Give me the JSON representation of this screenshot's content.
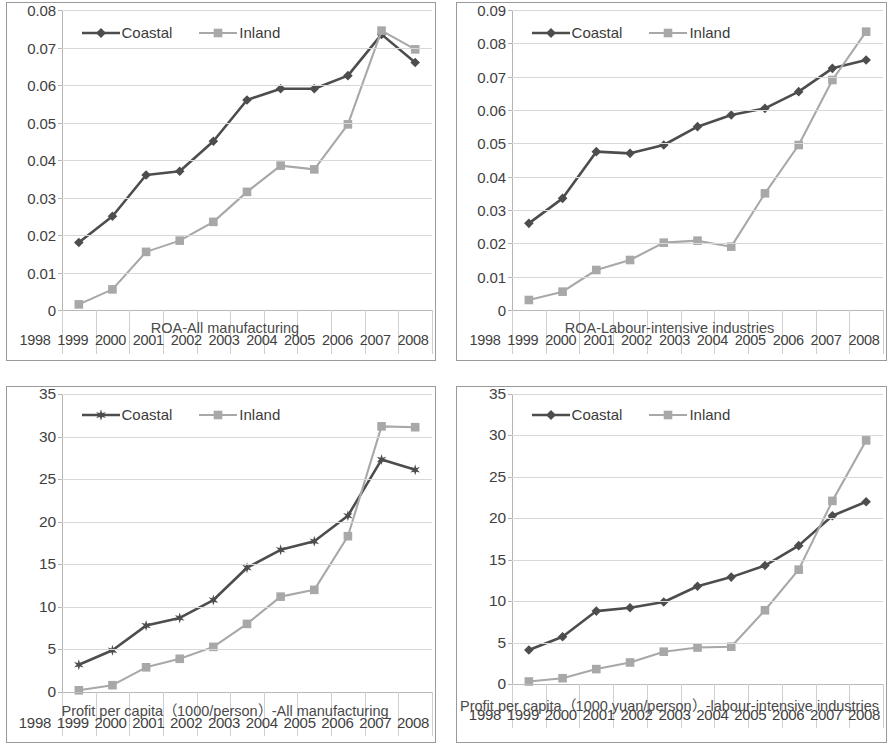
{
  "figure": {
    "panel_order": [
      "roa_all",
      "roa_labour",
      "profit_all",
      "profit_labour"
    ]
  },
  "chart_data": [
    {
      "id": "roa_all",
      "type": "line",
      "title": "ROA-All manufacturing",
      "xlabel": "",
      "ylabel": "",
      "grid": true,
      "legend_position": "top-left-inside",
      "categories": [
        "1998",
        "1999",
        "2000",
        "2001",
        "2002",
        "2003",
        "2004",
        "2005",
        "2006",
        "2007",
        "2008"
      ],
      "yticks": [
        "0",
        "0.01",
        "0.02",
        "0.03",
        "0.04",
        "0.05",
        "0.06",
        "0.07",
        "0.08"
      ],
      "ylim": [
        0,
        0.08
      ],
      "series": [
        {
          "name": "Coastal",
          "marker": "diamond",
          "color": "#4d4d4d",
          "values": [
            0.018,
            0.025,
            0.036,
            0.037,
            0.045,
            0.056,
            0.059,
            0.059,
            0.0625,
            0.0735,
            0.066
          ]
        },
        {
          "name": "Inland",
          "marker": "square",
          "color": "#a8a8a8",
          "values": [
            0.0015,
            0.0055,
            0.0155,
            0.0185,
            0.0235,
            0.0315,
            0.0385,
            0.0375,
            0.0495,
            0.0745,
            0.0695
          ]
        }
      ]
    },
    {
      "id": "roa_labour",
      "type": "line",
      "title": "ROA-Labour-intensive industries",
      "xlabel": "",
      "ylabel": "",
      "grid": true,
      "legend_position": "top-left-inside",
      "categories": [
        "1998",
        "1999",
        "2000",
        "2001",
        "2002",
        "2003",
        "2004",
        "2005",
        "2006",
        "2007",
        "2008"
      ],
      "yticks": [
        "0",
        "0.01",
        "0.02",
        "0.03",
        "0.04",
        "0.05",
        "0.06",
        "0.07",
        "0.08",
        "0.09"
      ],
      "ylim": [
        0,
        0.09
      ],
      "series": [
        {
          "name": "Coastal",
          "marker": "diamond",
          "color": "#4d4d4d",
          "values": [
            0.026,
            0.0335,
            0.0475,
            0.047,
            0.0495,
            0.055,
            0.0585,
            0.0605,
            0.0655,
            0.0725,
            0.075
          ]
        },
        {
          "name": "Inland",
          "marker": "square",
          "color": "#a8a8a8",
          "values": [
            0.003,
            0.0055,
            0.012,
            0.015,
            0.0202,
            0.0208,
            0.019,
            0.035,
            0.0495,
            0.069,
            0.0835
          ]
        }
      ]
    },
    {
      "id": "profit_all",
      "type": "line",
      "title": "Profit per capita（1000/person）-All manufacturing",
      "xlabel": "",
      "ylabel": "",
      "grid": true,
      "legend_position": "top-left-inside",
      "categories": [
        "1998",
        "1999",
        "2000",
        "2001",
        "2002",
        "2003",
        "2004",
        "2005",
        "2006",
        "2007",
        "2008"
      ],
      "yticks": [
        "0",
        "5",
        "10",
        "15",
        "20",
        "25",
        "30",
        "35"
      ],
      "ylim": [
        0,
        35
      ],
      "series": [
        {
          "name": "Coastal",
          "marker": "star",
          "color": "#4d4d4d",
          "values": [
            3.2,
            4.9,
            7.8,
            8.7,
            10.8,
            14.6,
            16.7,
            17.7,
            20.7,
            27.3,
            26.1
          ]
        },
        {
          "name": "Inland",
          "marker": "square",
          "color": "#a8a8a8",
          "values": [
            0.2,
            0.8,
            2.9,
            3.9,
            5.3,
            8.0,
            11.2,
            12.0,
            18.3,
            31.2,
            31.1
          ]
        }
      ]
    },
    {
      "id": "profit_labour",
      "type": "line",
      "title": "Profit per capita（1000 yuan/person）-labour-intensive industries",
      "xlabel": "",
      "ylabel": "",
      "grid": true,
      "legend_position": "top-left-inside",
      "categories": [
        "1998",
        "1999",
        "2000",
        "2001",
        "2002",
        "2003",
        "2004",
        "2005",
        "2006",
        "2007",
        "2008"
      ],
      "yticks": [
        "0",
        "5",
        "10",
        "15",
        "20",
        "25",
        "30",
        "35"
      ],
      "ylim": [
        0,
        35
      ],
      "series": [
        {
          "name": "Coastal",
          "marker": "diamond",
          "color": "#4d4d4d",
          "values": [
            4.1,
            5.7,
            8.8,
            9.2,
            9.9,
            11.8,
            12.9,
            14.3,
            16.7,
            20.3,
            22.0
          ]
        },
        {
          "name": "Inland",
          "marker": "square",
          "color": "#a8a8a8",
          "values": [
            0.3,
            0.7,
            1.8,
            2.6,
            3.9,
            4.4,
            4.5,
            8.9,
            13.8,
            22.1,
            29.4
          ]
        }
      ]
    }
  ],
  "colors": {
    "coastal": "#4d4d4d",
    "inland": "#a8a8a8",
    "grid": "#d7d7d7",
    "axis": "#b4b4b4",
    "frame": "#9a9a9a",
    "text": "#4a4a4a"
  }
}
